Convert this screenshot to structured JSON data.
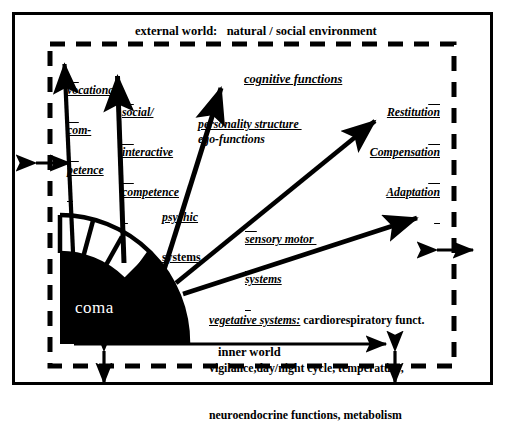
{
  "figure": {
    "type": "conceptual-diagram",
    "title_top": "external world:   natural / social environment",
    "title_bottom": "inner world",
    "core_label": "coma",
    "boundary_style": "dashed",
    "background": "#ffffff",
    "ink": "#000000"
  },
  "labels": {
    "external_world": "external world:   natural / social environment",
    "inner_world": "inner world",
    "coma": "coma",
    "vocational": [
      "vocational",
      "com-",
      "petence"
    ],
    "social": [
      "social/",
      "interactive",
      "competence"
    ],
    "cognitive": "cognitive functions",
    "personality": "personality structure ",
    "ego": "ego-functions",
    "psychic": [
      "psychic",
      "systems"
    ],
    "sensory": [
      "sensory motor ",
      "systems"
    ],
    "outcomes": [
      "Restitution",
      "Compensation",
      "Adaptation"
    ],
    "vegetative_lead": "vegetative systems:",
    "vegetative_rest": " cardiorespiratory funct.",
    "vegetative_line2": "vigilance,day/night cycle, temperature,",
    "vegetative_line3": "neuroendocrine functions, metabolism"
  },
  "arrows": {
    "radiating": [
      {
        "name": "vocational-competence-arrow",
        "from": [
          73,
          252
        ],
        "to": [
          64,
          60
        ]
      },
      {
        "name": "social-interactive-competence-arrow",
        "from": [
          124,
          263
        ],
        "to": [
          117,
          72
        ]
      },
      {
        "name": "cognitive-functions-arrow",
        "from": [
          163,
          273
        ],
        "to": [
          223,
          84
        ]
      },
      {
        "name": "sensory-motor-arrow",
        "from": [
          176,
          283
        ],
        "to": [
          378,
          118
        ]
      },
      {
        "name": "vegetative-systems-arrow",
        "from": [
          183,
          293
        ],
        "to": [
          420,
          216
        ]
      },
      {
        "name": "inner-world-arrow",
        "from": [
          74,
          344
        ],
        "to": [
          390,
          344
        ]
      }
    ],
    "exchange": [
      {
        "name": "exchange-arrow-left",
        "orientation": "horizontal",
        "cx": 52,
        "cy": 163
      },
      {
        "name": "exchange-arrow-right",
        "orientation": "horizontal",
        "cx": 455,
        "cy": 250
      },
      {
        "name": "exchange-arrow-bottom-left",
        "orientation": "vertical",
        "cx": 104,
        "cy": 366
      },
      {
        "name": "exchange-arrow-bottom-right",
        "orientation": "vertical",
        "cx": 395,
        "cy": 366
      }
    ]
  },
  "core": {
    "name": "coma-core",
    "center": [
      60,
      343
    ],
    "inner_radius": 90,
    "outer_radius": 128,
    "fill": "#000000",
    "text_fill": "#ffffff"
  }
}
